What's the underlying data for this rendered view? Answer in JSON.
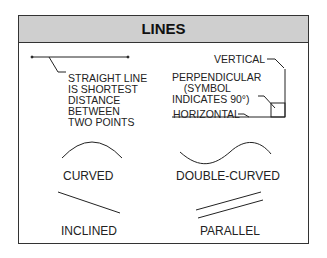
{
  "title": "LINES",
  "labels": {
    "straight": "STRAIGHT LINE\nIS SHORTEST\nDISTANCE\nBETWEEN\nTWO POINTS",
    "vertical": "VERTICAL",
    "perpendicular": "PERPENDICULAR\n    (SYMBOL\nINDICATES 90°)",
    "horizontal": "HORIZONTAL",
    "curved": "CURVED",
    "double_curved": "DOUBLE-CURVED",
    "inclined": "INCLINED",
    "parallel": "PARALLEL"
  }
}
